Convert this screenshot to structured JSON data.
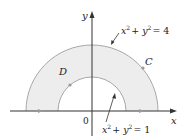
{
  "diagram": {
    "type": "annular-region",
    "axes": {
      "x_label": "x",
      "y_label": "y",
      "origin_label": "0"
    },
    "region_label": "D",
    "curve_label": "C",
    "outer_circle": {
      "equation_lhs": "x",
      "equation_rest": "+ y",
      "equation_rhs": "= 4",
      "radius": 2
    },
    "inner_circle": {
      "equation_lhs": "x",
      "equation_rest": "+ y",
      "equation_rhs": "= 1",
      "radius": 1
    },
    "exponent": "2",
    "colors": {
      "fill": "#ededed",
      "curve": "#a8a8a8",
      "axis": "#333333",
      "marker": "#9a9a9a"
    }
  }
}
